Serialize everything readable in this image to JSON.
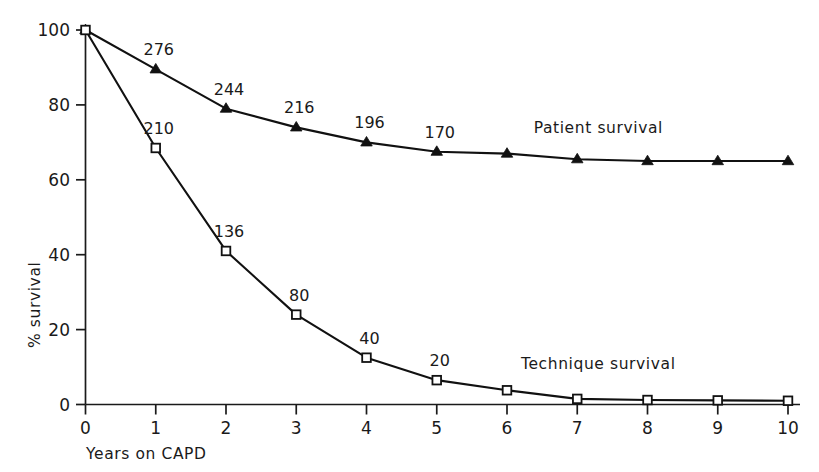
{
  "chart_data": {
    "type": "line",
    "title": "",
    "xlabel": "Years on CAPD",
    "ylabel": "% survival",
    "x": [
      0,
      1,
      2,
      3,
      4,
      5,
      6,
      7,
      8,
      9,
      10
    ],
    "xticklabels": [
      "0",
      "1",
      "2",
      "3",
      "4",
      "5",
      "6",
      "7",
      "8",
      "9",
      "10"
    ],
    "yticks": [
      0,
      20,
      40,
      60,
      80,
      100
    ],
    "yticklabels": [
      "0",
      "20",
      "40",
      "60",
      "80",
      "100"
    ],
    "xlim": [
      0,
      10
    ],
    "ylim": [
      0,
      100
    ],
    "grid": false,
    "legend_position": "inline-right",
    "series": [
      {
        "name": "Patient survival",
        "label": "Patient survival",
        "marker": "filled-triangle",
        "values": [
          100,
          89.5,
          79,
          74,
          70,
          67.5,
          67,
          65.5,
          65,
          65,
          65
        ],
        "point_labels": [
          "",
          "276",
          "244",
          "216",
          "196",
          "170",
          "",
          "",
          "",
          "",
          ""
        ]
      },
      {
        "name": "Technique survival",
        "label": "Technique survival",
        "marker": "open-square",
        "values": [
          100,
          68.5,
          41,
          24,
          12.5,
          6.5,
          3.8,
          1.5,
          1.2,
          1.1,
          1
        ],
        "point_labels": [
          "",
          "210",
          "136",
          "80",
          "40",
          "20",
          "",
          "",
          "",
          "",
          ""
        ]
      }
    ],
    "annotations": [
      {
        "text": "Patient survival",
        "x": 7.3,
        "y": 72.5
      },
      {
        "text": "Technique survival",
        "x": 7.3,
        "y": 9.5
      }
    ],
    "colors": {
      "axis": "#1a1a1a",
      "line": "#111111",
      "marker_fill_patient": "#111111",
      "marker_fill_technique": "#ffffff",
      "background": "#ffffff"
    }
  }
}
